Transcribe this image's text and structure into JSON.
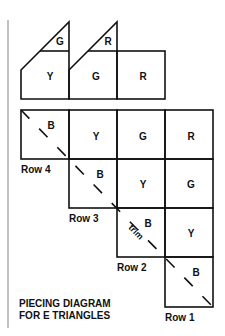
{
  "diagram": {
    "title_line1": "PIECING DIAGRAM",
    "title_line2": "FOR E TRIANGLES",
    "top_units": [
      {
        "triangle": "G",
        "base": "Y"
      },
      {
        "triangle": "R",
        "base": "G"
      },
      {
        "base": "R"
      }
    ],
    "grid": {
      "row4": {
        "label": "Row 4",
        "cells": [
          "B",
          "Y",
          "G",
          "R"
        ]
      },
      "row3": {
        "label": "Row 3",
        "cells": [
          "B",
          "Y",
          "G"
        ]
      },
      "row2": {
        "label": "Row 2",
        "cells": [
          "B",
          "Y"
        ]
      },
      "row1": {
        "label": "Row 1",
        "cells": [
          "B"
        ]
      }
    },
    "trim_label": "trim",
    "colors": {
      "line": "#111111",
      "background": "#ffffff",
      "rule": "#999999"
    }
  }
}
